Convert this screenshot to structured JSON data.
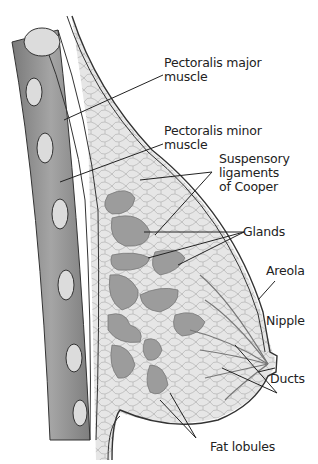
{
  "diagram": {
    "type": "anatomical cross-section",
    "colors": {
      "background": "#ffffff",
      "tissue_fill": "#e4e4e4",
      "gland_fill": "#9a9a9a",
      "muscle_fill": "#8c8c8c",
      "rib_fill": "#dcdcdc",
      "outline": "#333333",
      "leader_line": "#222222"
    },
    "labels": [
      {
        "id": "pectoralis-major",
        "text": "Pectoralis major\nmuscle"
      },
      {
        "id": "pectoralis-minor",
        "text": "Pectoralis minor\nmuscle"
      },
      {
        "id": "suspensory-ligaments",
        "text": "Suspensory\nligaments\nof Cooper"
      },
      {
        "id": "glands",
        "text": "Glands"
      },
      {
        "id": "areola",
        "text": "Areola"
      },
      {
        "id": "nipple",
        "text": "Nipple"
      },
      {
        "id": "ducts",
        "text": "Ducts"
      },
      {
        "id": "fat-lobules",
        "text": "Fat lobules"
      }
    ]
  }
}
